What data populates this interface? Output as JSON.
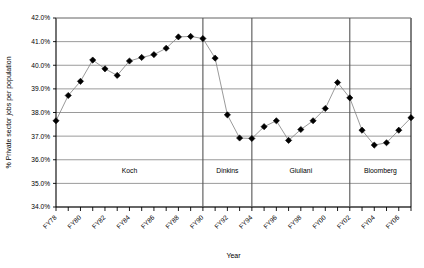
{
  "chart_data": {
    "type": "line",
    "title": "",
    "xlabel": "Year",
    "ylabel": "% Private sector jobs per population",
    "ylim": [
      34.0,
      42.0
    ],
    "ytick_step": 1.0,
    "ytick_labels": [
      "34.0%",
      "35.0%",
      "36.0%",
      "37.0%",
      "38.0%",
      "39.0%",
      "40.0%",
      "41.0%",
      "42.0%"
    ],
    "grid": true,
    "legend": "none",
    "marker": "diamond",
    "marker_color": "#000000",
    "line_color": "#808080",
    "x_start_label": "FY78",
    "x_end_label": "FY07",
    "xtick_labels": [
      "FY78",
      "FY80",
      "FY82",
      "FY84",
      "FY86",
      "FY88",
      "FY90",
      "FY92",
      "FY94",
      "FY96",
      "FY98",
      "FY00",
      "FY02",
      "FY04",
      "FY06"
    ],
    "x": [
      "FY78",
      "FY79",
      "FY80",
      "FY81",
      "FY82",
      "FY83",
      "FY84",
      "FY85",
      "FY86",
      "FY87",
      "FY88",
      "FY89",
      "FY90",
      "FY91",
      "FY92",
      "FY93",
      "FY94",
      "FY95",
      "FY96",
      "FY97",
      "FY98",
      "FY99",
      "FY00",
      "FY01",
      "FY02",
      "FY03",
      "FY04",
      "FY05",
      "FY06",
      "FY07"
    ],
    "values": [
      37.65,
      38.72,
      39.32,
      40.22,
      39.85,
      39.57,
      40.18,
      40.33,
      40.45,
      40.72,
      41.2,
      41.22,
      41.13,
      40.3,
      37.9,
      36.92,
      36.9,
      37.4,
      37.65,
      36.82,
      37.28,
      37.65,
      38.17,
      39.27,
      38.62,
      37.25,
      36.62,
      36.72,
      37.25,
      37.78
    ],
    "era_bands": [
      {
        "label": "Koch",
        "start": "FY78",
        "end": "FY90"
      },
      {
        "label": "Dinkins",
        "start": "FY90",
        "end": "FY94"
      },
      {
        "label": "Giuliani",
        "start": "FY94",
        "end": "FY02"
      },
      {
        "label": "Bloomberg",
        "start": "FY02",
        "end": "FY07"
      }
    ]
  }
}
